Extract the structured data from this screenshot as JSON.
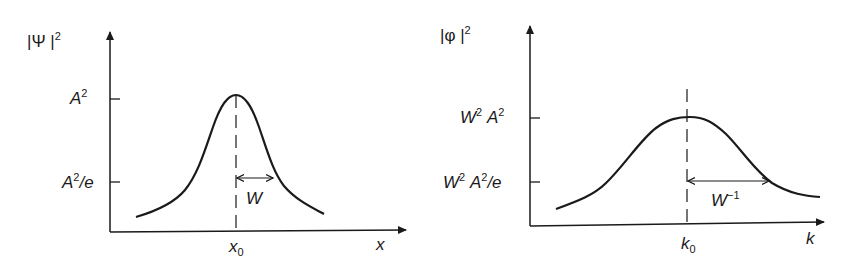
{
  "panels": [
    {
      "name": "position-space",
      "y_axis_label": {
        "pre": "|Ψ |",
        "sup": "2"
      },
      "x_axis_label": "x",
      "peak_tick": {
        "base": "A",
        "sup": "2",
        "post": ""
      },
      "e_tick": {
        "base": "A",
        "sup": "2",
        "post": "/e"
      },
      "center_label": {
        "base": "x",
        "sub": "0"
      },
      "width_label": {
        "base": "W",
        "sup": ""
      }
    },
    {
      "name": "momentum-space",
      "y_axis_label": {
        "pre": "|φ |",
        "sup": "2"
      },
      "x_axis_label": "k",
      "peak_tick": {
        "pre": "W",
        "sup1": "2",
        "base": "A",
        "sup": "2",
        "post": ""
      },
      "e_tick": {
        "pre": "W",
        "sup1": "2",
        "base": "A",
        "sup": "2",
        "post": "/e"
      },
      "center_label": {
        "base": "k",
        "sub": "0"
      },
      "width_label": {
        "base": "W",
        "sup": "−1"
      }
    }
  ],
  "colors": {
    "ink": "#1a1a1a",
    "background": "#ffffff"
  }
}
